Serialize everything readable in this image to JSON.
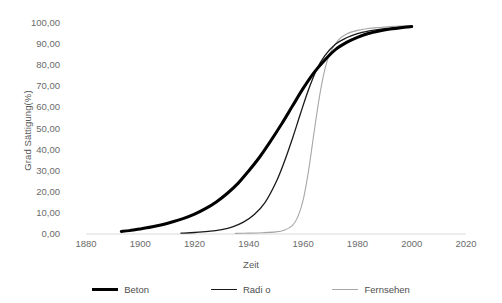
{
  "chart_data": {
    "type": "line",
    "title": "",
    "xlabel": "Zeit",
    "ylabel": "Grad Sättigung(%)",
    "xlim": [
      1880,
      2020
    ],
    "ylim": [
      0,
      100
    ],
    "xticks": [
      "1880",
      "1900",
      "1920",
      "1940",
      "1960",
      "1980",
      "2000",
      "2020"
    ],
    "yticks": [
      "0,00",
      "10,00",
      "20,00",
      "30,00",
      "40,00",
      "50,00",
      "60,00",
      "70,00",
      "80,00",
      "90,00",
      "100,00"
    ],
    "grid": false,
    "legend_position": "bottom",
    "series": [
      {
        "name": "Beton",
        "color": "#000000",
        "width": 3.0,
        "x": [
          1893,
          1896,
          1900,
          1904,
          1908,
          1912,
          1916,
          1920,
          1924,
          1928,
          1932,
          1936,
          1940,
          1944,
          1948,
          1952,
          1956,
          1960,
          1964,
          1968,
          1972,
          1976,
          1980,
          1984,
          1988,
          1992,
          1996,
          2000
        ],
        "y": [
          1.2,
          1.6,
          2.4,
          3.3,
          4.4,
          5.8,
          7.4,
          9.4,
          12.0,
          15.2,
          19.2,
          24.0,
          30.0,
          36.5,
          44.0,
          52.0,
          60.5,
          69.0,
          76.5,
          82.5,
          87.5,
          90.8,
          93.2,
          95.0,
          96.2,
          97.1,
          97.8,
          98.3
        ]
      },
      {
        "name": "Radi o",
        "color": "#1a1a1a",
        "width": 1.3,
        "x": [
          1915,
          1920,
          1925,
          1930,
          1934,
          1938,
          1942,
          1946,
          1950,
          1953,
          1956,
          1959,
          1962,
          1965,
          1968,
          1972,
          1976,
          1980,
          1984,
          1988,
          1992,
          1996,
          2000
        ],
        "y": [
          0.4,
          0.7,
          1.2,
          2.1,
          3.4,
          5.6,
          9.2,
          15.0,
          24.5,
          34.0,
          45.0,
          57.0,
          68.5,
          78.0,
          84.5,
          90.0,
          93.0,
          95.0,
          96.2,
          97.0,
          97.6,
          98.0,
          98.4
        ]
      },
      {
        "name": "Fernsehen",
        "color": "#a6a6a6",
        "width": 1.1,
        "x": [
          1935,
          1940,
          1945,
          1950,
          1953,
          1956,
          1958,
          1960,
          1962,
          1964,
          1966,
          1968,
          1970,
          1973,
          1976,
          1980,
          1984,
          1988,
          1992,
          1996,
          2000
        ],
        "y": [
          0.3,
          0.4,
          0.6,
          1.0,
          1.8,
          4.0,
          8.0,
          16.0,
          30.0,
          48.0,
          65.0,
          78.0,
          86.0,
          92.0,
          94.8,
          96.5,
          97.4,
          97.9,
          98.3,
          98.6,
          98.8
        ]
      }
    ]
  },
  "axes": {
    "y_title": "Grad Sättigung(%)",
    "x_title": "Zeit"
  },
  "legend": {
    "items": [
      {
        "label": "Beton"
      },
      {
        "label": "Radi o"
      },
      {
        "label": "Fernsehen"
      }
    ]
  }
}
